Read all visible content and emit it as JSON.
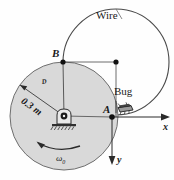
{
  "figure": {
    "type": "mechanics-diagram",
    "background_color": "#fefefe",
    "disk_fill_color": "#d9d9d9",
    "line_color": "#3a3a3a"
  },
  "labels": {
    "wire": "Wire",
    "bug": "Bug",
    "point_a": "A",
    "point_b": "B",
    "disk_symbol": "ᴰ",
    "radius_dimension": "0.3 m",
    "angular_velocity": "ω",
    "angular_velocity_sub": "0",
    "axis_x": "x",
    "axis_y": "y"
  },
  "geometry": {
    "disk_center": [
      64,
      116
    ],
    "disk_radius": 54,
    "wire_center": [
      116,
      62
    ],
    "wire_radius": 53,
    "point_a": [
      112,
      117
    ],
    "point_b": [
      63,
      62
    ],
    "radius_value_m": 0.3
  },
  "icons": {
    "pivot": "pin-support-icon",
    "bug": "bug-icon",
    "spin_arrow": "ccw-rotation-arrow-icon",
    "x_axis": "x-axis-arrow-icon",
    "y_axis": "y-axis-arrow-icon",
    "radius_arrow": "radius-dimension-arrow-icon",
    "wire_leader": "wire-leader-line-icon"
  }
}
